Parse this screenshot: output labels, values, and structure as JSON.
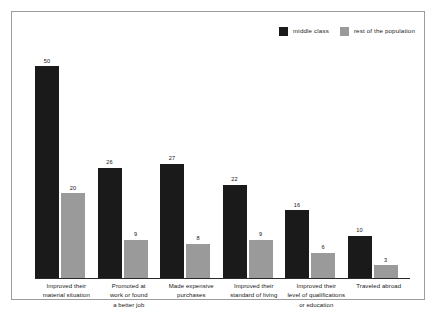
{
  "chart_data": {
    "type": "bar",
    "title": "",
    "subtitle": "",
    "xlabel": "",
    "ylabel": "",
    "ylim": [
      0,
      50
    ],
    "grid": false,
    "legend_position": "top-right",
    "categories": [
      "Improved their material situation",
      "Promoted at work or found a better job",
      "Made expensive purchases",
      "Improved their standard of living",
      "Improved their level of qualifications or education",
      "Traveled abroad"
    ],
    "category_lines": [
      [
        "Improved their",
        "material situation"
      ],
      [
        "Promoted at",
        "work or found",
        "a better job"
      ],
      [
        "Made expensive",
        "purchases"
      ],
      [
        "Improved their",
        "standard of living"
      ],
      [
        "Improved their",
        "level of qualifications",
        "or education"
      ],
      [
        "Traveled abroad"
      ]
    ],
    "series": [
      {
        "name": "middle class",
        "color": "#1a1a1a",
        "values": [
          50,
          26,
          27,
          22,
          16,
          10
        ]
      },
      {
        "name": "rest of the population",
        "color": "#9a9a9a",
        "values": [
          20,
          9,
          8,
          9,
          6,
          3
        ]
      }
    ]
  },
  "legend": {
    "items": [
      {
        "label": "middle class"
      },
      {
        "label": "rest of the population"
      }
    ]
  },
  "labels": {
    "g0s0": "50",
    "g0s1": "20",
    "g1s0": "26",
    "g1s1": "9",
    "g2s0": "27",
    "g2s1": "8",
    "g3s0": "22",
    "g3s1": "9",
    "g4s0": "16",
    "g4s1": "6",
    "g5s0": "10",
    "g5s1": "3"
  }
}
